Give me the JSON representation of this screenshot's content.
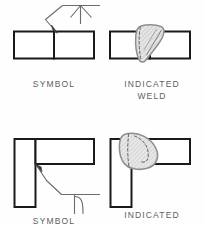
{
  "figure": {
    "background_color": "#fefefe",
    "line_color": "#1a1a1a",
    "thin_line_color": "#6b6b6b",
    "bead_fill_color": "#e3e3e3",
    "bead_outline_color": "#9a9a9a",
    "hatch_color": "#8c8c8c",
    "text_color": "#5d5d5d"
  },
  "panels": [
    {
      "id": "top-left",
      "label": "SYMBOL",
      "joint": "butt-joint",
      "symbol": "v-groove-weld-symbol",
      "symbol_side": "arrow-side-above-line",
      "description": "Two abutting plates with leader line, arrowhead at joint, horizontal reference line and V-groove symbol"
    },
    {
      "id": "top-right",
      "label_line1": "INDICATED",
      "label_line2": "WELD",
      "joint": "butt-joint",
      "weld": "v-groove-bead",
      "description": "Two abutting plates with shaded hatched V-groove weld bead crossing the joint"
    },
    {
      "id": "bottom-left",
      "label": "SYMBOL",
      "joint": "corner-joint",
      "symbol": "j-groove-weld-symbol",
      "symbol_side": "other-side-below-line",
      "description": "Corner joint with leader line, arrowhead at inside corner, reference line and J-groove symbol below"
    },
    {
      "id": "bottom-right",
      "label_line1": "INDICATED",
      "label_line2": "WELD",
      "joint": "corner-joint",
      "weld": "j-groove-bead",
      "description": "Corner joint with shaded J-groove weld bead at the inside corner, dashed groove profile"
    }
  ],
  "labels": {
    "symbol_top": "SYMBOL",
    "indicated_top_1": "INDICATED",
    "indicated_top_2": "WELD",
    "symbol_bottom": "SYMBOL",
    "indicated_bottom_1": "INDICATED",
    "indicated_bottom_2": "WELD"
  }
}
